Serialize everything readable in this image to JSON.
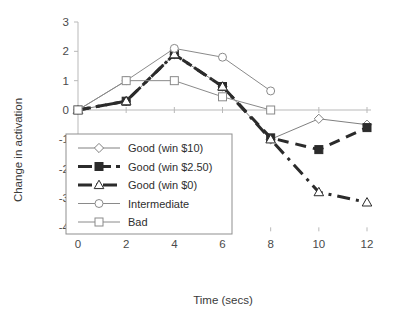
{
  "chart_data": {
    "type": "line",
    "title": "",
    "xlabel": "Time (secs)",
    "ylabel": "Change in activation",
    "x": [
      0,
      2,
      4,
      6,
      8,
      10,
      12
    ],
    "xticks": [
      "0",
      "2",
      "4",
      "6",
      "8",
      "10",
      "12"
    ],
    "yticks": [
      "3",
      "2",
      "1",
      "0",
      "-1",
      "-2",
      "-3",
      "-4"
    ],
    "xlim": [
      0,
      12
    ],
    "ylim": [
      -4,
      3
    ],
    "grid": false,
    "legend_position": "lower-left-inside",
    "series": [
      {
        "name": "Good (win $10)",
        "marker": "diamond-open",
        "linestyle": "solid",
        "linewidth": 1,
        "color": "#808080",
        "x": [
          0,
          2,
          4,
          6,
          8,
          10,
          12
        ],
        "values": [
          0,
          0.3,
          1.9,
          0.8,
          -1.0,
          -0.3,
          -0.5
        ]
      },
      {
        "name": "Good (win $2.50)",
        "marker": "square-filled",
        "linestyle": "dashed-thick",
        "linewidth": 3,
        "color": "#2b2b2b",
        "x": [
          0,
          2,
          4,
          6,
          8,
          10,
          12
        ],
        "values": [
          0,
          0.3,
          1.9,
          0.8,
          -0.95,
          -1.35,
          -0.6
        ]
      },
      {
        "name": "Good (win $0)",
        "marker": "triangle-open",
        "linestyle": "dash-dot-thick",
        "linewidth": 3,
        "color": "#2b2b2b",
        "x": [
          0,
          2,
          4,
          6,
          8,
          10,
          12
        ],
        "values": [
          0,
          0.3,
          1.9,
          0.8,
          -1.0,
          -2.8,
          -3.15
        ]
      },
      {
        "name": "Intermediate",
        "marker": "circle-open",
        "linestyle": "solid",
        "linewidth": 1,
        "color": "#8a8a8a",
        "x": [
          0,
          2,
          4,
          6,
          8
        ],
        "values": [
          0,
          1.0,
          2.1,
          1.8,
          0.65
        ]
      },
      {
        "name": "Bad",
        "marker": "square-open",
        "linestyle": "solid",
        "linewidth": 1,
        "color": "#8a8a8a",
        "x": [
          0,
          2,
          4,
          6,
          8
        ],
        "values": [
          0,
          1.0,
          1.0,
          0.45,
          0.0
        ]
      }
    ]
  },
  "legend": {
    "items": [
      {
        "label": "Good (win $10)"
      },
      {
        "label": "Good (win $2.50)"
      },
      {
        "label": "Good (win $0)"
      },
      {
        "label": "Intermediate"
      },
      {
        "label": "Bad"
      }
    ]
  },
  "axes": {
    "x_title": "Time (secs)",
    "y_title": "Change in activation",
    "x_tick_labels": [
      "0",
      "2",
      "4",
      "6",
      "8",
      "10",
      "12"
    ],
    "y_tick_labels": [
      "3",
      "2",
      "1",
      "0",
      "-1",
      "-2",
      "-3",
      "-4"
    ]
  }
}
